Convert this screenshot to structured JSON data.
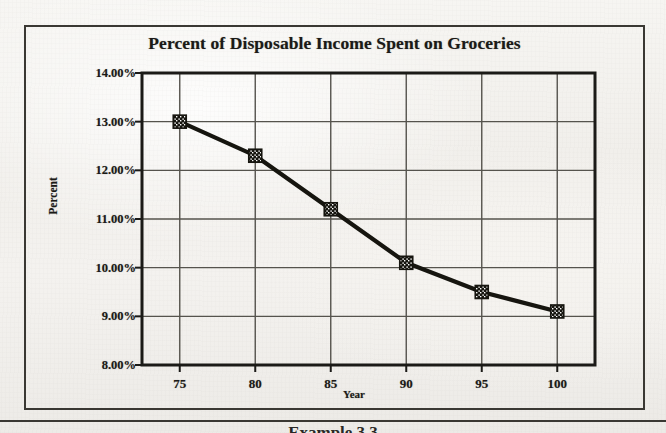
{
  "chart_data": {
    "type": "line",
    "title": "Percent of Disposable Income Spent on Groceries",
    "xlabel": "Year",
    "ylabel": "Percent",
    "x": [
      75,
      80,
      85,
      90,
      95,
      100
    ],
    "values": [
      13.0,
      12.3,
      11.2,
      10.1,
      9.5,
      9.1
    ],
    "x_tick_labels": [
      "75",
      "80",
      "85",
      "90",
      "95",
      "100"
    ],
    "y_tick_labels": [
      "14.00%",
      "13.00%",
      "12.00%",
      "11.00%",
      "10.00%",
      "9.00%",
      "8.00%"
    ],
    "y_tick_values": [
      14,
      13,
      12,
      11,
      10,
      9,
      8
    ],
    "xlim": [
      72.5,
      102.5
    ],
    "ylim": [
      8,
      14
    ],
    "grid": true,
    "legend": false,
    "marker": "filled-square-pattern",
    "series_color": "#16150f",
    "grid_color": "#55534d",
    "axis_color": "#1b1a17"
  },
  "figure": {
    "bottom_caption": "Example 3.3"
  }
}
